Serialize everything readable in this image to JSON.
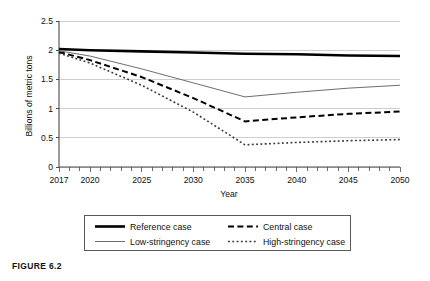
{
  "figure": {
    "caption": "FIGURE 6.2"
  },
  "chart_data": {
    "type": "line",
    "title": "",
    "xlabel": "Year",
    "ylabel": "Billions of metric tons",
    "xlim": [
      2017,
      2050
    ],
    "ylim": [
      0,
      2.5
    ],
    "yticks": [
      "0",
      "0.5",
      "1",
      "1.5",
      "2",
      "2.5"
    ],
    "ytick_values": [
      0,
      0.5,
      1,
      1.5,
      2,
      2.5
    ],
    "xticks": [
      "2017",
      "2020",
      "2025",
      "2030",
      "2035",
      "2040",
      "2045",
      "2050"
    ],
    "xtick_values": [
      2017,
      2020,
      2025,
      2030,
      2035,
      2040,
      2045,
      2050
    ],
    "minor_tick_interval": 1,
    "grid": "horizontal",
    "legend_position": "below-axes",
    "x": [
      2017,
      2020,
      2025,
      2030,
      2035,
      2040,
      2045,
      2050
    ],
    "series": [
      {
        "name": "Reference case",
        "style": "solid-thick",
        "color": "#000000",
        "values": [
          2.02,
          2.0,
          1.98,
          1.96,
          1.94,
          1.93,
          1.91,
          1.9
        ]
      },
      {
        "name": "Central case",
        "style": "dashed",
        "color": "#000000",
        "values": [
          1.97,
          1.83,
          1.54,
          1.18,
          0.78,
          0.85,
          0.91,
          0.95
        ]
      },
      {
        "name": "Low-stringency case",
        "style": "solid-thin",
        "color": "#6e6e6e",
        "values": [
          1.99,
          1.9,
          1.68,
          1.44,
          1.2,
          1.28,
          1.35,
          1.4
        ]
      },
      {
        "name": "High-stringency case",
        "style": "dotted",
        "color": "#3a3a3a",
        "values": [
          1.95,
          1.78,
          1.4,
          0.94,
          0.38,
          0.42,
          0.45,
          0.47
        ]
      }
    ],
    "legend": [
      {
        "label": "Reference case",
        "style": "solid-thick"
      },
      {
        "label": "Central case",
        "style": "dashed"
      },
      {
        "label": "Low-stringency case",
        "style": "solid-thin"
      },
      {
        "label": "High-stringency case",
        "style": "dotted"
      }
    ]
  }
}
